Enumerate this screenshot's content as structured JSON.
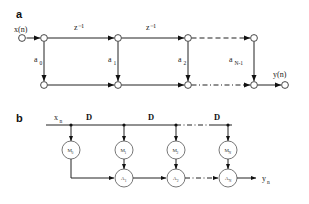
{
  "figure": {
    "panels": [
      {
        "letter": "a",
        "input_label": "x(n)",
        "output_label": "y(n)",
        "delay_labels": [
          "z⁻¹",
          "z⁻¹"
        ],
        "coef_labels": [
          {
            "base": "a",
            "sub": "0"
          },
          {
            "base": "a",
            "sub": "1"
          },
          {
            "base": "a",
            "sub": "2"
          },
          {
            "base": "a",
            "sub": "N-1"
          }
        ]
      },
      {
        "letter": "b",
        "input_label": "x",
        "input_sub": "n",
        "output_label": "y",
        "output_sub": "n",
        "delay_labels": [
          "D",
          "D",
          "D"
        ],
        "mult_nodes": [
          {
            "base": "M",
            "sub": "0"
          },
          {
            "base": "M",
            "sub": "1"
          },
          {
            "base": "M",
            "sub": "2"
          },
          {
            "base": "M",
            "sub": "N"
          }
        ],
        "add_nodes": [
          {
            "base": "A",
            "sub": "1"
          },
          {
            "base": "A",
            "sub": "2"
          },
          {
            "base": "A",
            "sub": "N"
          }
        ]
      }
    ],
    "colors": {
      "background": "#ffffff",
      "line": "#222222",
      "text": "#1a1a1a",
      "node_fill": "#ffffff",
      "node_stroke": "#333333"
    }
  }
}
